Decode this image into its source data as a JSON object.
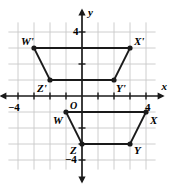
{
  "figure": {
    "title": "",
    "background_color": "#ffffff",
    "grid_color": "#c8c8c8",
    "axis_color": "#1a1a1a",
    "shape_color": "#1a1a1a",
    "origin_label": "O",
    "x_axis_label": "x",
    "y_axis_label": "y"
  },
  "axes": {
    "x_ticks": [
      {
        "value": -4,
        "label": "−4",
        "show_label": true
      },
      {
        "value": -3,
        "label": "",
        "show_label": false
      },
      {
        "value": -2,
        "label": "",
        "show_label": false
      },
      {
        "value": -1,
        "label": "",
        "show_label": false
      },
      {
        "value": 1,
        "label": "",
        "show_label": false
      },
      {
        "value": 2,
        "label": "",
        "show_label": false
      },
      {
        "value": 3,
        "label": "",
        "show_label": false
      },
      {
        "value": 4,
        "label": "4",
        "show_label": true
      }
    ],
    "y_ticks": [
      {
        "value": 4,
        "label": "4",
        "show_label": true
      },
      {
        "value": 3,
        "label": "",
        "show_label": false
      },
      {
        "value": 2,
        "label": "",
        "show_label": false
      },
      {
        "value": 1,
        "label": "",
        "show_label": false
      },
      {
        "value": -1,
        "label": "",
        "show_label": false
      },
      {
        "value": -2,
        "label": "",
        "show_label": false
      },
      {
        "value": -3,
        "label": "",
        "show_label": false
      },
      {
        "value": -4,
        "label": "−4",
        "show_label": true
      }
    ],
    "xlim": [
      -5,
      5
    ],
    "ylim": [
      -5,
      5
    ],
    "grid": true
  },
  "chart_data": {
    "type": "scatter",
    "title": "",
    "xlabel": "x",
    "ylabel": "y",
    "xlim": [
      -5,
      5
    ],
    "ylim": [
      -5,
      5
    ],
    "grid": true,
    "legend": "none",
    "series": [
      {
        "name": "Trapezoid W'X'Y'Z' (image)",
        "closed": true,
        "points": [
          {
            "label": "W'",
            "x": -3,
            "y": 3,
            "label_dx": -13,
            "label_dy": -12
          },
          {
            "label": "X'",
            "x": 3,
            "y": 3,
            "label_dx": 4,
            "label_dy": -12
          },
          {
            "label": "Y'",
            "x": 2,
            "y": 1,
            "label_dx": 2,
            "label_dy": 3
          },
          {
            "label": "Z'",
            "x": -2,
            "y": 1,
            "label_dx": -13,
            "label_dy": 3
          }
        ]
      },
      {
        "name": "Trapezoid WXYZ (preimage)",
        "closed": true,
        "points": [
          {
            "label": "W",
            "x": -1,
            "y": -1,
            "label_dx": -13,
            "label_dy": 3
          },
          {
            "label": "X",
            "x": 4,
            "y": -1,
            "label_dx": 4,
            "label_dy": 3
          },
          {
            "label": "Y",
            "x": 3,
            "y": -3,
            "label_dx": 4,
            "label_dy": 1
          },
          {
            "label": "Z",
            "x": 0,
            "y": -3,
            "label_dx": -12,
            "label_dy": 1
          }
        ]
      }
    ]
  }
}
